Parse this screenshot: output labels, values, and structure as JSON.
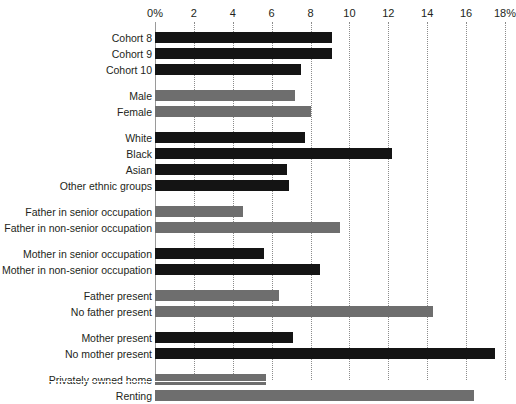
{
  "chart_data": {
    "type": "bar",
    "orientation": "horizontal",
    "title": "",
    "subtitle": "",
    "xlabel": "",
    "ylabel": "",
    "xlim": [
      0,
      18
    ],
    "grid": true,
    "legend": "none",
    "tick_labels": [
      "0%",
      "2",
      "4",
      "6",
      "8",
      "10",
      "12",
      "14",
      "16",
      "18%"
    ],
    "tick_values": [
      0,
      2,
      4,
      6,
      8,
      10,
      12,
      14,
      16,
      18
    ],
    "colors": {
      "dark": "#141414",
      "light": "#6e6e6e",
      "gridline": "#8c8c8c",
      "axis": "#9a9a9a",
      "text": "#231f20",
      "background": "#ffffff"
    },
    "groups": [
      {
        "name": "cohort",
        "series_color": "dark",
        "categories": [
          "Cohort 8",
          "Cohort 9",
          "Cohort 10"
        ],
        "values": [
          9.1,
          9.1,
          7.5
        ]
      },
      {
        "name": "sex",
        "series_color": "light",
        "categories": [
          "Male",
          "Female"
        ],
        "values": [
          7.2,
          8.0
        ]
      },
      {
        "name": "ethnicity",
        "series_color": "dark",
        "categories": [
          "White",
          "Black",
          "Asian",
          "Other ethnic groups"
        ],
        "values": [
          7.7,
          12.2,
          6.8,
          6.9
        ]
      },
      {
        "name": "father-occupation",
        "series_color": "light",
        "categories": [
          "Father in senior occupation",
          "Father in non-senior occupation"
        ],
        "values": [
          4.5,
          9.5
        ]
      },
      {
        "name": "mother-occupation",
        "series_color": "dark",
        "categories": [
          "Mother in senior occupation",
          "Mother in non-senior occupation"
        ],
        "values": [
          5.6,
          8.5
        ]
      },
      {
        "name": "father-presence",
        "series_color": "light",
        "categories": [
          "Father present",
          "No father present"
        ],
        "values": [
          6.4,
          14.3
        ]
      },
      {
        "name": "mother-presence",
        "series_color": "dark",
        "categories": [
          "Mother present",
          "No mother present"
        ],
        "values": [
          7.1,
          17.5
        ]
      },
      {
        "name": "housing-tenure",
        "series_color": "light",
        "categories": [
          "Privately owned home",
          "Renting"
        ],
        "values": [
          5.7,
          16.4
        ]
      }
    ]
  }
}
